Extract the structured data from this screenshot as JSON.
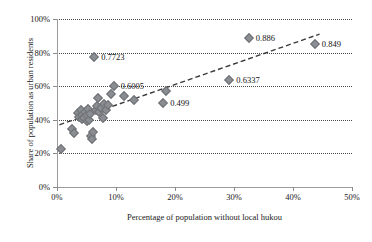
{
  "chart_data": {
    "type": "scatter",
    "title": "",
    "xlabel": "Percentage of population without local hukou",
    "ylabel": "Share of population as urban residents",
    "xlim": [
      0,
      50
    ],
    "ylim": [
      0,
      100
    ],
    "x_ticks": [
      "0%",
      "10%",
      "20%",
      "30%",
      "40%",
      "50%"
    ],
    "x_tick_values": [
      0,
      10,
      20,
      30,
      40,
      50
    ],
    "y_ticks": [
      "0%",
      "20%",
      "40%",
      "60%",
      "80%",
      "100%"
    ],
    "y_tick_values": [
      0,
      20,
      40,
      60,
      80,
      100
    ],
    "grid": "horizontal-dotted",
    "legend": "none",
    "marker": {
      "shape": "diamond",
      "color": "#8a8d92",
      "edge_color": "#6d7075",
      "size": 7
    },
    "trendline": {
      "style": "dashed",
      "color": "#3a3a3a",
      "x_start": 0.4,
      "y_start": 37.0,
      "x_end": 44.5,
      "y_end": 91.0
    },
    "points": [
      {
        "x": 0.6,
        "y": 22.6,
        "label": ""
      },
      {
        "x": 2.6,
        "y": 34.6,
        "label": ""
      },
      {
        "x": 2.8,
        "y": 32.0,
        "label": ""
      },
      {
        "x": 3.5,
        "y": 44.0,
        "label": ""
      },
      {
        "x": 3.8,
        "y": 41.8,
        "label": ""
      },
      {
        "x": 4.0,
        "y": 46.0,
        "label": ""
      },
      {
        "x": 4.2,
        "y": 43.0,
        "label": ""
      },
      {
        "x": 4.3,
        "y": 40.2,
        "label": ""
      },
      {
        "x": 4.6,
        "y": 41.0,
        "label": ""
      },
      {
        "x": 4.8,
        "y": 44.6,
        "label": ""
      },
      {
        "x": 5.0,
        "y": 39.4,
        "label": ""
      },
      {
        "x": 5.1,
        "y": 42.6,
        "label": ""
      },
      {
        "x": 5.3,
        "y": 46.4,
        "label": ""
      },
      {
        "x": 5.4,
        "y": 40.0,
        "label": ""
      },
      {
        "x": 5.6,
        "y": 43.6,
        "label": ""
      },
      {
        "x": 5.8,
        "y": 30.2,
        "label": ""
      },
      {
        "x": 5.9,
        "y": 28.8,
        "label": ""
      },
      {
        "x": 6.1,
        "y": 32.6,
        "label": ""
      },
      {
        "x": 6.3,
        "y": 77.2,
        "label": "0.7723"
      },
      {
        "x": 6.6,
        "y": 45.8,
        "label": ""
      },
      {
        "x": 6.8,
        "y": 48.0,
        "label": ""
      },
      {
        "x": 7.0,
        "y": 53.2,
        "label": ""
      },
      {
        "x": 7.2,
        "y": 44.8,
        "label": ""
      },
      {
        "x": 7.5,
        "y": 47.0,
        "label": ""
      },
      {
        "x": 7.8,
        "y": 41.0,
        "label": ""
      },
      {
        "x": 8.0,
        "y": 49.4,
        "label": ""
      },
      {
        "x": 8.3,
        "y": 46.0,
        "label": ""
      },
      {
        "x": 8.6,
        "y": 48.6,
        "label": ""
      },
      {
        "x": 9.2,
        "y": 55.2,
        "label": ""
      },
      {
        "x": 9.6,
        "y": 60.0,
        "label": "0.6005"
      },
      {
        "x": 11.3,
        "y": 54.0,
        "label": ""
      },
      {
        "x": 13.0,
        "y": 51.8,
        "label": ""
      },
      {
        "x": 18.0,
        "y": 49.9,
        "label": "0.499"
      },
      {
        "x": 18.4,
        "y": 57.4,
        "label": ""
      },
      {
        "x": 29.2,
        "y": 63.4,
        "label": "0.6337"
      },
      {
        "x": 32.5,
        "y": 88.6,
        "label": "0.886"
      },
      {
        "x": 43.7,
        "y": 84.9,
        "label": "0.849"
      }
    ],
    "annotations": [
      {
        "text": "0.7723",
        "x": 6.3,
        "y": 77.2
      },
      {
        "text": "0.6005",
        "x": 9.6,
        "y": 60.0
      },
      {
        "text": "0.499",
        "x": 18.0,
        "y": 49.9
      },
      {
        "text": "0.6337",
        "x": 29.2,
        "y": 63.4
      },
      {
        "text": "0.886",
        "x": 32.5,
        "y": 88.6
      },
      {
        "text": "0.849",
        "x": 43.7,
        "y": 84.9
      }
    ]
  }
}
